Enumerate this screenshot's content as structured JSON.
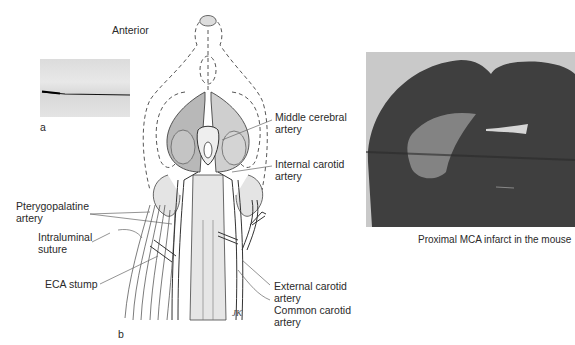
{
  "panel_a": {
    "label": "a",
    "description": "photo of intraluminal suture"
  },
  "panel_b": {
    "label": "b",
    "orientation_label": "Anterior",
    "signature": "JK",
    "labels": {
      "mca": [
        "Middle cerebral",
        "artery"
      ],
      "ica": [
        "Internal carotid",
        "artery"
      ],
      "ppa": [
        "Pterygopalatine",
        "artery"
      ],
      "suture": [
        "Intraluminal",
        "suture"
      ],
      "eca_stump": [
        "ECA stump"
      ],
      "eca": [
        "External carotid",
        "artery"
      ],
      "cca": [
        "Common carotid",
        "artery"
      ]
    }
  },
  "photo": {
    "caption": "Proximal MCA infarct in the mouse"
  },
  "colors": {
    "background": "#ffffff",
    "line": "#555555",
    "tissue": "#3f3f3f",
    "infarct": "#8f8f8f"
  }
}
